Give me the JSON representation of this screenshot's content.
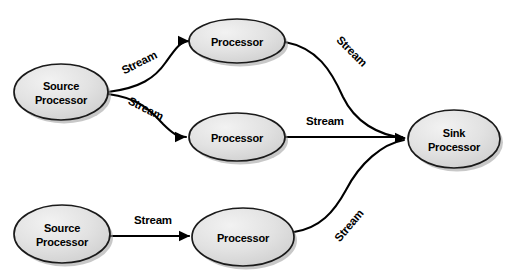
{
  "diagram": {
    "background_color": "#ffffff",
    "node_fill_color": "#dcdcdc",
    "node_stroke_color": "#1a1a1a",
    "edge_color": "#000000",
    "nodes": [
      {
        "id": "source-processor-top",
        "kind": "source",
        "label_line1": "Source",
        "label_line2": "Processor",
        "cx": 61,
        "cy": 92,
        "rx": 47,
        "ry": 28
      },
      {
        "id": "processor-top",
        "kind": "processor",
        "label_line1": "Processor",
        "label_line2": "",
        "cx": 237,
        "cy": 41,
        "rx": 48,
        "ry": 22
      },
      {
        "id": "processor-middle",
        "kind": "processor",
        "label_line1": "Processor",
        "label_line2": "",
        "cx": 237,
        "cy": 137,
        "rx": 48,
        "ry": 24
      },
      {
        "id": "sink-processor",
        "kind": "sink",
        "label_line1": "Sink",
        "label_line2": "Processor",
        "cx": 454,
        "cy": 139,
        "rx": 46,
        "ry": 29
      },
      {
        "id": "source-processor-bottom",
        "kind": "source",
        "label_line1": "Source",
        "label_line2": "Processor",
        "cx": 62,
        "cy": 234,
        "rx": 48,
        "ry": 29
      },
      {
        "id": "processor-bottom",
        "kind": "processor",
        "label_line1": "Processor",
        "label_line2": "",
        "cx": 243,
        "cy": 237,
        "rx": 51,
        "ry": 29
      }
    ],
    "edges": [
      {
        "id": "edge-source-top-to-processor-top",
        "from": "source-processor-top",
        "to": "processor-top",
        "label": "Stream",
        "label_x": 141,
        "label_y": 66,
        "label_rotation": -27,
        "path": "M 108 92 C 140 88 155 78 166 62 C 176 48 180 42 189 41"
      },
      {
        "id": "edge-source-top-to-processor-middle",
        "from": "source-processor-top",
        "to": "processor-middle",
        "label": "Stream",
        "label_x": 144,
        "label_y": 112,
        "label_rotation": 27,
        "path": "M 108 94 C 140 98 152 112 163 124 C 173 134 178 137 186 137"
      },
      {
        "id": "edge-processor-top-to-sink",
        "from": "processor-top",
        "to": "sink-processor",
        "label": "Stream",
        "label_x": 349,
        "label_y": 54,
        "label_rotation": 45,
        "path": "M 285 42 C 317 48 331 70 343 97 C 355 122 378 135 404 138"
      },
      {
        "id": "edge-processor-middle-to-sink",
        "from": "processor-middle",
        "to": "sink-processor",
        "label": "Stream",
        "label_x": 325,
        "label_y": 125,
        "label_rotation": 0,
        "path": "M 285 137 L 402 137"
      },
      {
        "id": "edge-source-bottom-to-processor-bottom",
        "from": "source-processor-bottom",
        "to": "processor-bottom",
        "label": "Stream",
        "label_x": 153,
        "label_y": 224,
        "label_rotation": 0,
        "path": "M 110 236 L 189 236"
      },
      {
        "id": "edge-processor-bottom-to-sink",
        "from": "processor-bottom",
        "to": "sink-processor",
        "label": "Stream",
        "label_x": 352,
        "label_y": 228,
        "label_rotation": -50,
        "path": "M 294 232 C 320 228 334 212 346 190 C 360 163 382 144 404 140"
      }
    ],
    "arrowheads": [
      {
        "id": "arrowhead-processor-top",
        "x": 189,
        "y": 41,
        "rotation": 0
      },
      {
        "id": "arrowhead-processor-middle",
        "x": 186,
        "y": 137,
        "rotation": 0
      },
      {
        "id": "arrowhead-processor-bottom",
        "x": 190,
        "y": 236,
        "rotation": 0
      },
      {
        "id": "arrowhead-sink",
        "x": 406,
        "y": 138,
        "rotation": 0
      }
    ]
  }
}
